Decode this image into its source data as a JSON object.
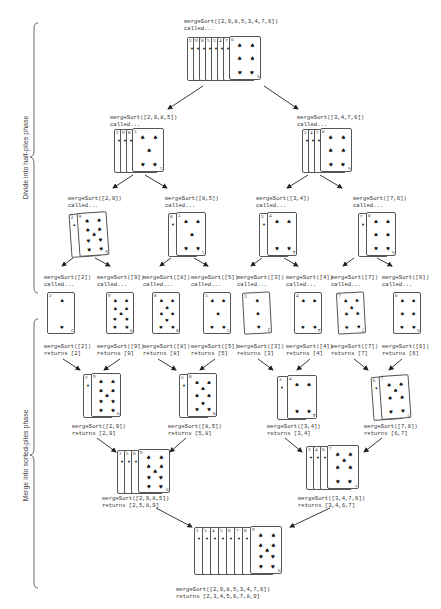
{
  "phases": {
    "divide": "Divide into half-piles phase",
    "merge": "Merge into sorted-piles phase"
  },
  "nodes": {
    "root_call": {
      "line1": "mergeSort([2,9,8,5,3,4,7,6])",
      "line2": "called..."
    },
    "l_call": {
      "line1": "mergeSort([2,9,8,5])",
      "line2": "called..."
    },
    "r_call": {
      "line1": "mergeSort([3,4,7,6])",
      "line2": "called..."
    },
    "ll_call": {
      "line1": "mergeSort([2,9])",
      "line2": "called..."
    },
    "lr_call": {
      "line1": "mergeSort([8,5])",
      "line2": "called..."
    },
    "rl_call": {
      "line1": "mergeSort([3,4])",
      "line2": "called..."
    },
    "rr_call": {
      "line1": "mergeSort([7,6])",
      "line2": "called..."
    },
    "leaf_calls": [
      {
        "line1": "mergeSort([2])",
        "line2": "called..."
      },
      {
        "line1": "mergeSort([9])",
        "line2": "called..."
      },
      {
        "line1": "mergeSort([8])",
        "line2": "called..."
      },
      {
        "line1": "mergeSort([5])",
        "line2": "called..."
      },
      {
        "line1": "mergeSort([3])",
        "line2": "called..."
      },
      {
        "line1": "mergeSort([4])",
        "line2": "called..."
      },
      {
        "line1": "mergeSort([7])",
        "line2": "called..."
      },
      {
        "line1": "mergeSort([6])",
        "line2": "called..."
      }
    ],
    "leaf_returns": [
      {
        "line1": "mergeSort([2])",
        "line2": "returns [2]"
      },
      {
        "line1": "mergeSort([9])",
        "line2": "returns [9]"
      },
      {
        "line1": "mergeSort([8])",
        "line2": "returns [8]"
      },
      {
        "line1": "mergeSort([5])",
        "line2": "returns [5]"
      },
      {
        "line1": "mergeSort([3])",
        "line2": "returns [3]"
      },
      {
        "line1": "mergeSort([4])",
        "line2": "returns [4]"
      },
      {
        "line1": "mergeSort([7])",
        "line2": "returns [7]"
      },
      {
        "line1": "mergeSort([6])",
        "line2": "returns [6]"
      }
    ],
    "ll_ret": {
      "line1": "mergeSort([2,9])",
      "line2": "returns [2,9]"
    },
    "lr_ret": {
      "line1": "mergeSort([8,5])",
      "line2": "returns [5,8]"
    },
    "rl_ret": {
      "line1": "mergeSort([3,4])",
      "line2": "returns [3,4]"
    },
    "rr_ret": {
      "line1": "mergeSort([7,6])",
      "line2": "returns [6,7]"
    },
    "l_ret": {
      "line1": "mergeSort([2,9,8,5])",
      "line2": "returns [2,5,8,9]"
    },
    "r_ret": {
      "line1": "mergeSort([3,4,7,6])",
      "line2": "returns [3,4,6,7]"
    },
    "root_ret": {
      "line1": "mergeSort([2,9,8,5,3,4,7,6])",
      "line2": "returns [2,3,4,5,6,7,8,9]"
    }
  },
  "card_ranks": {
    "root_call": [
      "2",
      "9",
      "8",
      "5",
      "3",
      "4",
      "7",
      "6"
    ],
    "l_call": [
      "2",
      "9",
      "8",
      "5"
    ],
    "r_call": [
      "3",
      "4",
      "7",
      "6"
    ],
    "ll_call": [
      "2",
      "9"
    ],
    "lr_call": [
      "8",
      "5"
    ],
    "rl_call": [
      "3",
      "4"
    ],
    "rr_call": [
      "7",
      "6"
    ],
    "leaves": [
      "2",
      "9",
      "8",
      "5",
      "3",
      "4",
      "7",
      "6"
    ],
    "ll_ret": [
      "2",
      "9"
    ],
    "lr_ret": [
      "5",
      "8"
    ],
    "rl_ret": [
      "3",
      "4"
    ],
    "rr_ret": [
      "6",
      "7"
    ],
    "l_ret": [
      "2",
      "5",
      "8",
      "9"
    ],
    "r_ret": [
      "3",
      "4",
      "6",
      "7"
    ],
    "root_ret": [
      "2",
      "3",
      "4",
      "5",
      "6",
      "7",
      "8",
      "9"
    ]
  },
  "suit_icon": "spade-icon"
}
